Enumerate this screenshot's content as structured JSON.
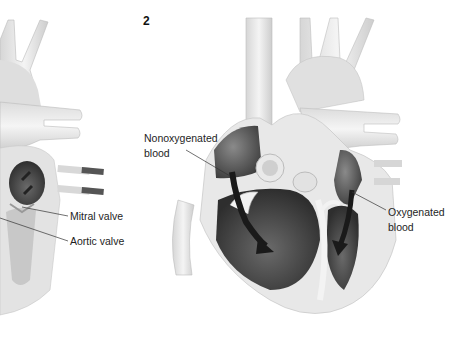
{
  "figure": {
    "panel_number": "2",
    "labels": {
      "mitral_valve": "Mitral valve",
      "aortic_valve": "Aortic valve",
      "nonoxygenated_line1": "Nonoxygenated",
      "nonoxygenated_line2": "blood",
      "oxygenated_line1": "Oxygenated",
      "oxygenated_line2": "blood"
    },
    "colors": {
      "background": "#ffffff",
      "vessel_light": "#ececec",
      "vessel_mid": "#cfcfcf",
      "chamber_dark": "#4a4a4a",
      "arrow": "#1a1a1a",
      "leader_line": "#333333"
    }
  }
}
